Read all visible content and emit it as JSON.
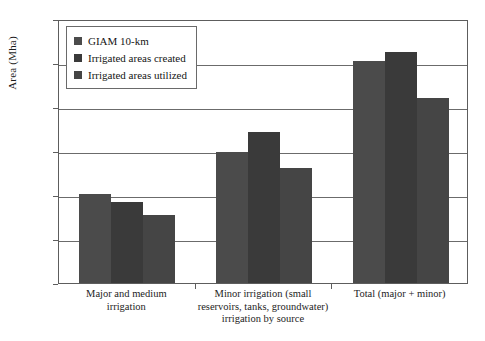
{
  "chart_data": {
    "type": "bar",
    "title": "",
    "xlabel": "",
    "ylabel": "Area (Mha)",
    "ylim": [
      0,
      120
    ],
    "ytick_values": [
      0,
      20,
      40,
      60,
      80,
      100,
      120
    ],
    "ytick_labels": [
      "0",
      "20",
      "40",
      "60",
      "80",
      "100",
      "120"
    ],
    "grid": true,
    "legend_position": "top-left",
    "categories": [
      "Major and medium\nirrigation",
      "Minor irrigation (small\nreservoirs, tanks, groundwater)\nirrigation by source",
      "Total (major + minor)"
    ],
    "category_lines": [
      [
        "Major and medium",
        "irrigation"
      ],
      [
        "Minor irrigation (small",
        "reservoirs, tanks, groundwater)",
        "irrigation by source"
      ],
      [
        "Total (major + minor)"
      ]
    ],
    "series": [
      {
        "name": "GIAM 10-km",
        "color": "#4b4b4b",
        "values": [
          40.5,
          59.5,
          101.0
        ]
      },
      {
        "name": "Irrigated areas created",
        "color": "#3a3a3a",
        "values": [
          36.8,
          68.5,
          105.0
        ]
      },
      {
        "name": "Irrigated areas utilized",
        "color": "#454545",
        "values": [
          31.0,
          52.5,
          84.0
        ]
      }
    ]
  },
  "legend": {
    "items": [
      {
        "label": "GIAM 10-km"
      },
      {
        "label": "Irrigated areas created"
      },
      {
        "label": "Irrigated areas utilized"
      }
    ]
  }
}
